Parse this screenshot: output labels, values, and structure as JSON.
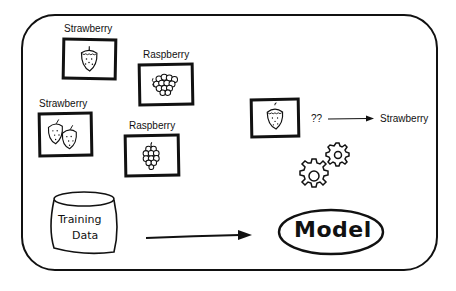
{
  "diagram": {
    "training_examples": [
      {
        "label": "Strawberry",
        "icon": "strawberry-icon",
        "count": 1
      },
      {
        "label": "Raspberry",
        "icon": "raspberry-icon",
        "count": 1
      },
      {
        "label": "Strawberry",
        "icon": "strawberry-icon",
        "count": 2
      },
      {
        "label": "Raspberry",
        "icon": "raspberry-icon",
        "count": 1
      }
    ],
    "training_data": {
      "line1": "Training",
      "line2": "Data"
    },
    "model": {
      "label": "Model"
    },
    "prediction": {
      "input_icon": "strawberry-icon",
      "unknown": "??",
      "output": "Strawberry"
    },
    "gears_icon": "gears-icon",
    "colors": {
      "ink": "#111111",
      "background": "#ffffff"
    }
  }
}
